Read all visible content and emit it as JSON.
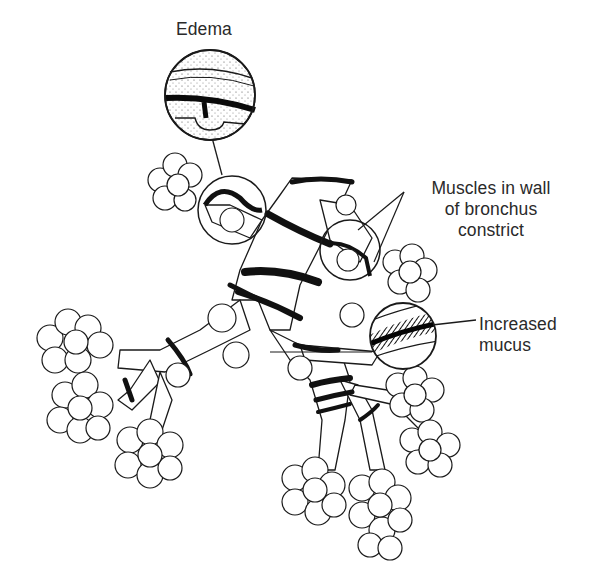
{
  "figure": {
    "colors": {
      "ink": "#1a1a1a",
      "background": "#ffffff",
      "label_text": "#2a2a2a"
    }
  },
  "labels": {
    "edema": {
      "text": "Edema"
    },
    "muscles": {
      "lines": [
        "Muscles in wall",
        "of bronchus",
        "constrict"
      ]
    },
    "mucus": {
      "lines": [
        "Increased",
        "mucus"
      ]
    }
  },
  "callouts": [
    {
      "name": "edema-inset",
      "label": "Edema",
      "detail": "cross-section of swollen airway wall"
    },
    {
      "name": "muscle-inset",
      "label": "Muscles in wall of bronchus constrict",
      "detail": "magnified constricted bronchus segment"
    },
    {
      "name": "mucus-inset",
      "label": "Increased mucus",
      "detail": "striped cross-section of mucus layer"
    }
  ]
}
